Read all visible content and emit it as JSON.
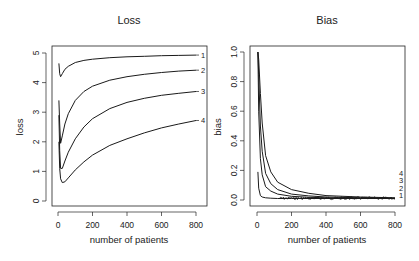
{
  "chart_data": [
    {
      "type": "line",
      "title": "Loss",
      "xlabel": "number of patients",
      "ylabel": "loss",
      "xlim": [
        0,
        800
      ],
      "ylim": [
        0,
        5
      ],
      "xticks": [
        0,
        200,
        400,
        600,
        800
      ],
      "xtick_labels": [
        "0",
        "200",
        "400",
        "600",
        "800"
      ],
      "yticks": [
        0,
        1,
        2,
        3,
        4,
        5
      ],
      "ytick_labels": [
        "0",
        "1",
        "2",
        "3",
        "4",
        "5"
      ],
      "grid": false,
      "legend": "curve labels at right end of each line",
      "series": [
        {
          "name": "1",
          "x": [
            5,
            10,
            15,
            25,
            40,
            60,
            100,
            150,
            200,
            300,
            400,
            500,
            600,
            700,
            800
          ],
          "y": [
            4.65,
            4.3,
            4.2,
            4.3,
            4.45,
            4.55,
            4.68,
            4.75,
            4.79,
            4.84,
            4.87,
            4.89,
            4.91,
            4.92,
            4.93
          ]
        },
        {
          "name": "2",
          "x": [
            5,
            10,
            15,
            25,
            40,
            60,
            100,
            150,
            200,
            300,
            400,
            500,
            600,
            700,
            800
          ],
          "y": [
            3.4,
            2.6,
            1.95,
            2.2,
            2.6,
            2.95,
            3.4,
            3.7,
            3.88,
            4.08,
            4.2,
            4.28,
            4.34,
            4.39,
            4.42
          ]
        },
        {
          "name": "3",
          "x": [
            5,
            10,
            15,
            25,
            40,
            60,
            100,
            150,
            200,
            300,
            400,
            500,
            600,
            700,
            800
          ],
          "y": [
            2.9,
            1.7,
            1.1,
            1.1,
            1.35,
            1.65,
            2.1,
            2.5,
            2.78,
            3.12,
            3.33,
            3.47,
            3.57,
            3.64,
            3.7
          ]
        },
        {
          "name": "4",
          "x": [
            5,
            10,
            15,
            25,
            40,
            60,
            100,
            150,
            200,
            300,
            400,
            500,
            600,
            700,
            800
          ],
          "y": [
            2.0,
            1.1,
            0.75,
            0.62,
            0.65,
            0.78,
            1.05,
            1.32,
            1.55,
            1.88,
            2.1,
            2.3,
            2.47,
            2.6,
            2.72
          ]
        }
      ]
    },
    {
      "type": "line",
      "title": "Bias",
      "xlabel": "number of patients",
      "ylabel": "bias",
      "xlim": [
        0,
        800
      ],
      "ylim": [
        0,
        1.0
      ],
      "xticks": [
        0,
        200,
        400,
        600,
        800
      ],
      "xtick_labels": [
        "0",
        "200",
        "400",
        "600",
        "800"
      ],
      "yticks": [
        0.0,
        0.2,
        0.4,
        0.6,
        0.8,
        1.0
      ],
      "ytick_labels": [
        "0.0",
        "0.2",
        "0.4",
        "0.6",
        "0.8",
        "1.0"
      ],
      "grid": false,
      "legend": "stacked labels 4,3,2,1 at right",
      "series": [
        {
          "name": "1",
          "x": [
            5,
            10,
            20,
            30,
            50,
            80,
            120,
            200,
            400,
            600,
            800
          ],
          "y": [
            0.19,
            0.08,
            0.03,
            0.02,
            0.015,
            0.012,
            0.01,
            0.01,
            0.01,
            0.01,
            0.01
          ]
        },
        {
          "name": "2",
          "x": [
            5,
            10,
            20,
            30,
            50,
            80,
            120,
            200,
            300,
            400,
            600,
            800
          ],
          "y": [
            1.0,
            0.6,
            0.28,
            0.17,
            0.09,
            0.06,
            0.04,
            0.025,
            0.018,
            0.015,
            0.012,
            0.01
          ]
        },
        {
          "name": "3",
          "x": [
            5,
            10,
            20,
            30,
            50,
            80,
            120,
            200,
            300,
            400,
            600,
            800
          ],
          "y": [
            1.0,
            0.85,
            0.5,
            0.33,
            0.18,
            0.11,
            0.07,
            0.04,
            0.028,
            0.02,
            0.015,
            0.012
          ]
        },
        {
          "name": "4",
          "x": [
            5,
            10,
            20,
            30,
            50,
            80,
            120,
            200,
            300,
            400,
            600,
            800
          ],
          "y": [
            1.0,
            0.95,
            0.72,
            0.52,
            0.3,
            0.19,
            0.12,
            0.07,
            0.045,
            0.03,
            0.02,
            0.015
          ]
        }
      ],
      "curve_labels": [
        "4",
        "3",
        "2",
        "1"
      ]
    }
  ]
}
